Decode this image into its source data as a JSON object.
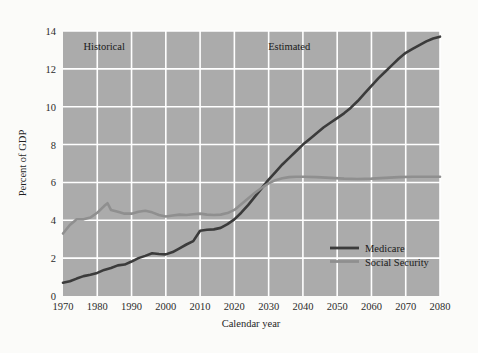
{
  "chart_data": {
    "type": "line",
    "title": "",
    "xlabel": "Calendar year",
    "ylabel": "Percent of GDP",
    "xlim": [
      1970,
      2080
    ],
    "ylim": [
      0,
      14
    ],
    "xticks": [
      1970,
      1980,
      1990,
      2000,
      2010,
      2020,
      2030,
      2040,
      2050,
      2060,
      2070,
      2080
    ],
    "yticks": [
      0,
      2,
      4,
      6,
      8,
      10,
      12,
      14
    ],
    "grid": true,
    "legend_position": "bottom-right",
    "plot_background": "#ababab",
    "gridline_color": "#ffffff",
    "figure_background": "#fbfbf9",
    "annotations": [
      {
        "text": "Historical",
        "x": 1982,
        "y": 13.0
      },
      {
        "text": "Estimated",
        "x": 2036,
        "y": 13.0
      }
    ],
    "series": [
      {
        "name": "Medicare",
        "color": "#3b3b3b",
        "width": 2.6,
        "x": [
          1970,
          1972,
          1974,
          1976,
          1978,
          1980,
          1982,
          1984,
          1986,
          1988,
          1990,
          1992,
          1994,
          1996,
          1998,
          2000,
          2002,
          2004,
          2006,
          2008,
          2010,
          2012,
          2014,
          2016,
          2018,
          2020,
          2022,
          2024,
          2026,
          2028,
          2030,
          2032,
          2034,
          2036,
          2038,
          2040,
          2042,
          2044,
          2046,
          2048,
          2050,
          2052,
          2054,
          2056,
          2058,
          2060,
          2062,
          2064,
          2066,
          2068,
          2070,
          2072,
          2074,
          2076,
          2078,
          2080
        ],
        "y": [
          0.7,
          0.78,
          0.92,
          1.05,
          1.12,
          1.22,
          1.38,
          1.48,
          1.62,
          1.66,
          1.82,
          2.0,
          2.12,
          2.26,
          2.22,
          2.2,
          2.32,
          2.52,
          2.72,
          2.9,
          3.45,
          3.5,
          3.52,
          3.6,
          3.8,
          4.05,
          4.4,
          4.8,
          5.25,
          5.7,
          6.15,
          6.55,
          6.95,
          7.3,
          7.65,
          8.0,
          8.3,
          8.6,
          8.9,
          9.15,
          9.4,
          9.65,
          9.95,
          10.3,
          10.7,
          11.1,
          11.5,
          11.85,
          12.2,
          12.55,
          12.85,
          13.05,
          13.25,
          13.45,
          13.6,
          13.7
        ]
      },
      {
        "name": "Social Security",
        "color": "#8f8f8f",
        "width": 2.6,
        "x": [
          1970,
          1972,
          1974,
          1976,
          1978,
          1980,
          1982,
          1983,
          1984,
          1986,
          1988,
          1990,
          1992,
          1994,
          1996,
          1998,
          2000,
          2002,
          2004,
          2006,
          2008,
          2010,
          2012,
          2014,
          2016,
          2018,
          2020,
          2022,
          2024,
          2026,
          2028,
          2030,
          2032,
          2034,
          2036,
          2038,
          2040,
          2044,
          2048,
          2052,
          2056,
          2060,
          2064,
          2068,
          2072,
          2076,
          2080
        ],
        "y": [
          3.3,
          3.75,
          4.05,
          4.05,
          4.15,
          4.4,
          4.75,
          4.9,
          4.55,
          4.45,
          4.35,
          4.35,
          4.45,
          4.5,
          4.42,
          4.28,
          4.2,
          4.25,
          4.3,
          4.28,
          4.32,
          4.35,
          4.3,
          4.28,
          4.3,
          4.38,
          4.55,
          4.85,
          5.15,
          5.45,
          5.72,
          5.95,
          6.12,
          6.22,
          6.28,
          6.3,
          6.3,
          6.28,
          6.24,
          6.2,
          6.18,
          6.2,
          6.24,
          6.28,
          6.3,
          6.3,
          6.3
        ]
      }
    ],
    "legend": [
      {
        "label": "Medicare",
        "color": "#3b3b3b"
      },
      {
        "label": "Social Security",
        "color": "#8f8f8f"
      }
    ]
  }
}
